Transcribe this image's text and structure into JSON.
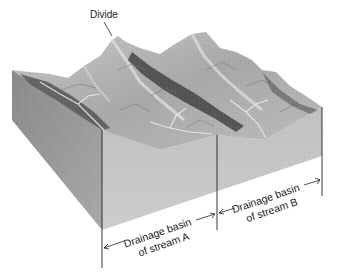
{
  "figure": {
    "type": "block-diagram"
  },
  "labels": {
    "divide": "Divide",
    "basin_a": {
      "line1": "Drainage basin",
      "line2": "of stream A"
    },
    "basin_b": {
      "line1": "Drainage basin",
      "line2": "of stream B"
    }
  },
  "colors": {
    "background": "#ffffff",
    "front_left_face": "#9a9a9a",
    "front_right_face": "#c4c4c4",
    "terrain_light": "#d0d0d0",
    "terrain_mid": "#9e9e9e",
    "terrain_dark": "#444444",
    "lines": "#222222"
  }
}
